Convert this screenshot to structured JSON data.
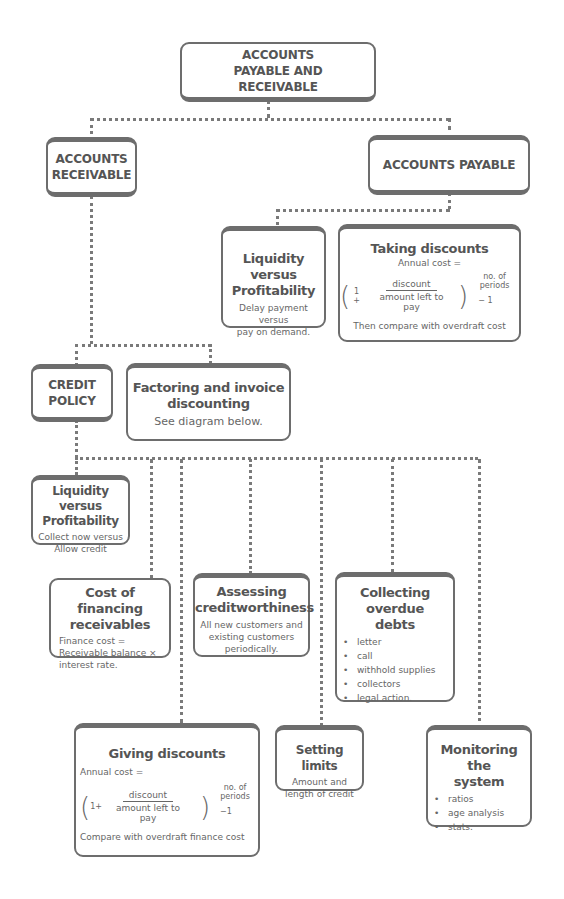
{
  "diagram": {
    "root": {
      "label": "ACCOUNTS PAYABLE AND RECEIVABLE"
    },
    "accounts_receivable": {
      "label_line1": "ACCOUNTS",
      "label_line2": "RECEIVABLE"
    },
    "accounts_payable": {
      "label": "ACCOUNTS PAYABLE"
    },
    "payable_liquidity": {
      "title_line1": "Liquidity versus",
      "title_line2": "Profitability",
      "body_line1": "Delay payment versus",
      "body_line2": "pay on demand."
    },
    "taking_discounts": {
      "title": "Taking discounts",
      "annual_cost": "Annual cost =",
      "formula": {
        "open_paren": "(",
        "one_plus": "1 +",
        "numerator": "discount",
        "denominator": "amount left to pay",
        "close_paren": ")",
        "exponent": "no. of periods",
        "minus_one": "− 1"
      },
      "footer": "Then compare with overdraft cost"
    },
    "credit_policy": {
      "label_line1": "CREDIT",
      "label_line2": "POLICY"
    },
    "factoring": {
      "title_line1": "Factoring and invoice",
      "title_line2": "discounting",
      "body": "See diagram below."
    },
    "receivable_liquidity": {
      "title_line1": "Liquidity versus",
      "title_line2": "Profitability",
      "body_line1": "Collect now versus",
      "body_line2": "Allow credit"
    },
    "cost_of_financing": {
      "title_line1": "Cost of financing",
      "title_line2": "receivables",
      "body_line1": "Finance cost =",
      "body_line2": "Receivable balance ×",
      "body_line3": "interest rate."
    },
    "assessing": {
      "title_line1": "Assessing",
      "title_line2": "creditworthiness",
      "body_line1": "All new customers and",
      "body_line2": "existing customers",
      "body_line3": "periodically."
    },
    "collecting": {
      "title_line1": "Collecting overdue",
      "title_line2": "debts",
      "items": [
        "letter",
        "call",
        "withhold supplies",
        "collectors",
        "legal action."
      ]
    },
    "giving_discounts": {
      "title": "Giving discounts",
      "annual_cost": "Annual cost =",
      "formula": {
        "open_paren": "(",
        "one_plus": "1+",
        "numerator": "discount",
        "denominator": "amount left to pay",
        "close_paren": ")",
        "exponent": "no. of periods",
        "minus_one": "−1"
      },
      "footer": "Compare with overdraft finance cost"
    },
    "setting_limits": {
      "title": "Setting limits",
      "body_line1": "Amount and",
      "body_line2": "length of credit"
    },
    "monitoring": {
      "title_line1": "Monitoring the",
      "title_line2": "system",
      "items": [
        "ratios",
        "age analysis",
        "stats."
      ]
    }
  },
  "colors": {
    "border": "#6d6d6d",
    "text": "#555555",
    "connector": "#7a7a7a"
  }
}
